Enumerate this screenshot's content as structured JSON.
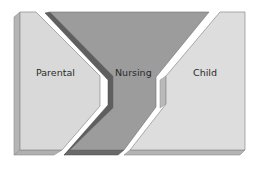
{
  "diagram": {
    "type": "process-flow",
    "panels": [
      {
        "id": "parental",
        "label": "Parental",
        "face_color": "#d7d7d7",
        "edge_color": "#a9a9a9"
      },
      {
        "id": "nursing",
        "label": "Nursing",
        "face_color": "#9b9b9b",
        "edge_color": "#5e5e5e"
      },
      {
        "id": "child",
        "label": "Child",
        "face_color": "#dedede",
        "edge_color": "#ababab"
      }
    ]
  }
}
